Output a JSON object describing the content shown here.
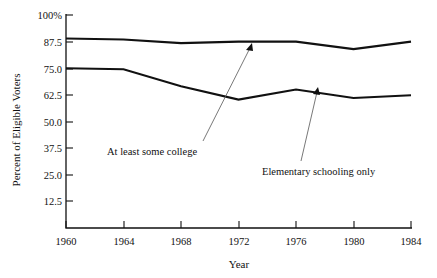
{
  "chart_data": {
    "type": "line",
    "title": "",
    "xlabel": "Year",
    "ylabel": "Percent of Eligible Voters",
    "x": [
      1960,
      1964,
      1968,
      1972,
      1976,
      1980,
      1984
    ],
    "xlim": [
      1960,
      1984
    ],
    "ylim": [
      0,
      100
    ],
    "xtick_labels": [
      "1960",
      "1964",
      "1968",
      "1972",
      "1976",
      "1980",
      "1984"
    ],
    "ytick_values": [
      12.5,
      25.0,
      37.5,
      50.0,
      62.5,
      75.0,
      87.5,
      100
    ],
    "ytick_labels": [
      "12.5",
      "25.0",
      "37.5",
      "50.0",
      "62.5",
      "75.0",
      "87.5",
      "100%"
    ],
    "grid": false,
    "legend": "none",
    "series": [
      {
        "name": "At least some college",
        "values": [
          89.0,
          88.5,
          86.8,
          87.5,
          87.5,
          84.0,
          87.5
        ]
      },
      {
        "name": "Elementary schooling only",
        "values": [
          75.0,
          74.5,
          66.5,
          60.3,
          65.0,
          61.0,
          62.3
        ]
      }
    ],
    "annotations": [
      {
        "text": "At least some college",
        "series": "At least some college",
        "points_to_year": 1972,
        "points_to_value": 87.5
      },
      {
        "text": "Elementary schooling only",
        "series": "Elementary schooling only",
        "points_to_year": 1977,
        "points_to_value": 63.5
      }
    ]
  }
}
